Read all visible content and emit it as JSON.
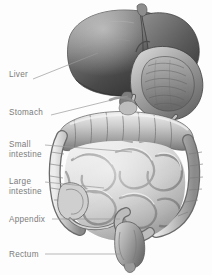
{
  "figure": {
    "background_color": "#fdfdfd",
    "label_color": "#7b7b7b",
    "leader_color": "#9a9a9a",
    "width": 212,
    "height": 275
  },
  "labels": [
    {
      "key": "liver",
      "text": "Liver",
      "x": 9,
      "y": 70,
      "line": [
        33,
        79,
        98,
        53
      ]
    },
    {
      "key": "stomach",
      "text": "Stomach",
      "x": 9,
      "y": 108,
      "line": [
        51,
        115,
        128,
        96
      ]
    },
    {
      "key": "small_intestine",
      "text": "Small\nintestine",
      "x": 9,
      "y": 140,
      "line": [
        45,
        145,
        132,
        152
      ]
    },
    {
      "key": "large_intestine",
      "text": "Large\nintestine",
      "x": 9,
      "y": 177,
      "line": [
        45,
        182,
        104,
        188
      ]
    },
    {
      "key": "appendix",
      "text": "Appendix",
      "x": 9,
      "y": 215,
      "line": [
        52,
        219,
        120,
        219
      ]
    },
    {
      "key": "rectum",
      "text": "Rectum",
      "x": 9,
      "y": 250,
      "line": [
        45,
        254,
        120,
        254
      ]
    }
  ],
  "organs": [
    {
      "key": "liver",
      "name": "Liver"
    },
    {
      "key": "stomach",
      "name": "Stomach"
    },
    {
      "key": "transverse_colon",
      "name": "Transverse colon"
    },
    {
      "key": "small_intestine",
      "name": "Small intestine"
    },
    {
      "key": "ascending_colon",
      "name": "Ascending colon"
    },
    {
      "key": "descending_colon",
      "name": "Descending colon"
    },
    {
      "key": "cecum",
      "name": "Cecum"
    },
    {
      "key": "appendix",
      "name": "Appendix"
    },
    {
      "key": "sigmoid_colon",
      "name": "Sigmoid colon"
    },
    {
      "key": "rectum",
      "name": "Rectum"
    }
  ]
}
